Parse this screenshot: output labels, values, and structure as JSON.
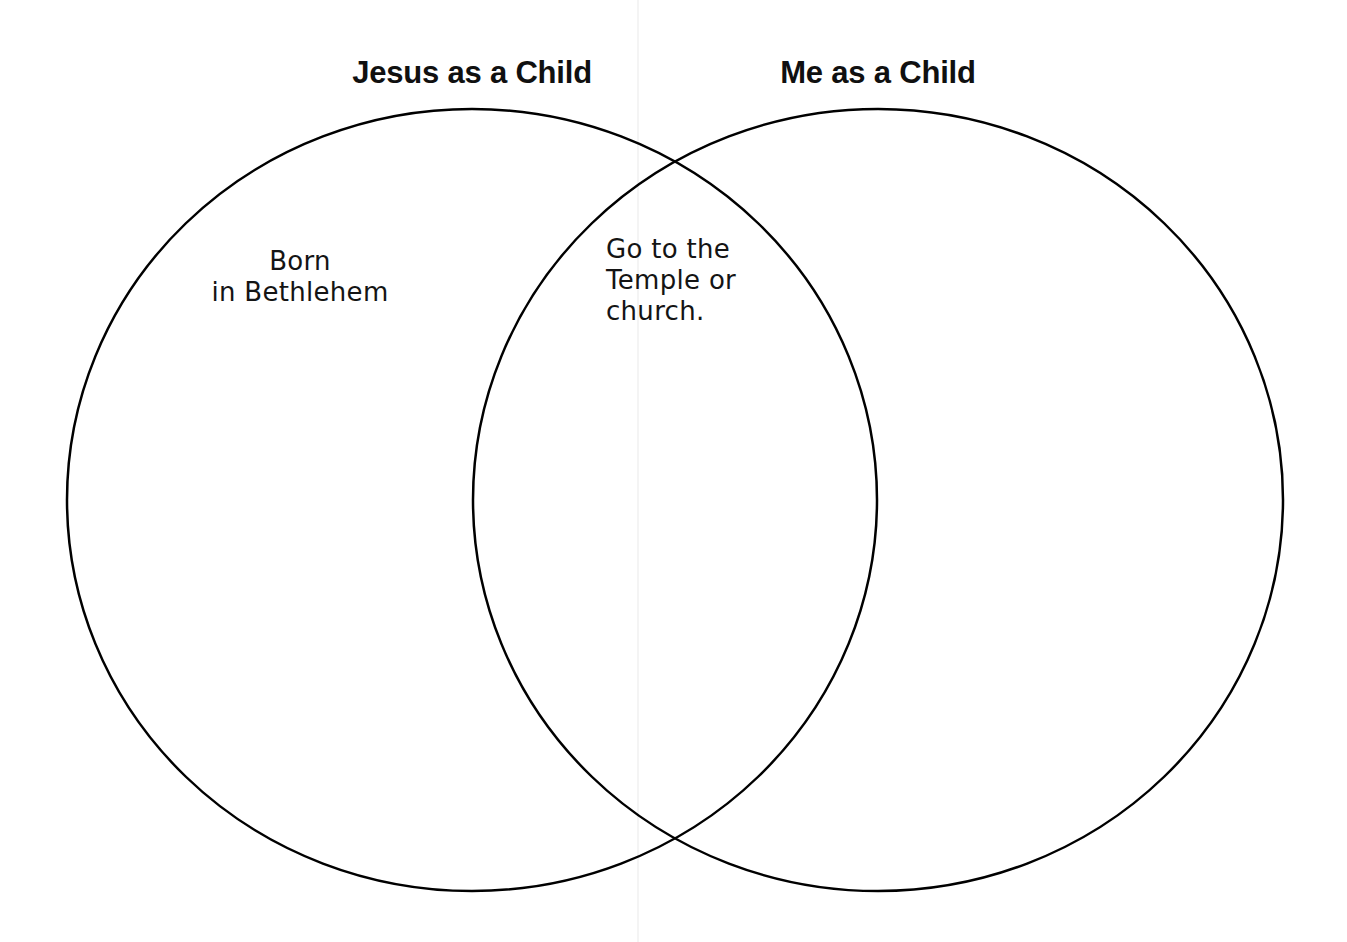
{
  "page": {
    "background_color": "#ffffff",
    "ink_color": "#000000",
    "width": 1347,
    "height": 942
  },
  "headings": {
    "left": "Jesus as a Child",
    "right": "Me as a Child"
  },
  "notes": {
    "left_only": "Born\nin Bethlehem",
    "intersection": "Go to the\nTemple or\nchurch.",
    "right_only": ""
  },
  "chart_data": {
    "type": "venn",
    "title": "",
    "sets": [
      {
        "name": "Jesus as a Child",
        "label": "Jesus as a Child",
        "cx": 472,
        "cy": 500,
        "rx": 405,
        "ry": 391,
        "items": [
          "Born in Bethlehem"
        ]
      },
      {
        "name": "Me as a Child",
        "label": "Me as a Child",
        "cx": 878,
        "cy": 500,
        "rx": 405,
        "ry": 391,
        "items": []
      }
    ],
    "intersection": {
      "label": "",
      "items": [
        "Go to the Temple or church."
      ],
      "upper_crossing": [
        675,
        162
      ],
      "lower_crossing": [
        675,
        840
      ]
    },
    "stroke_color": "#000000",
    "stroke_width": 2.5,
    "fill": "none",
    "legend": "none",
    "grid": false
  }
}
